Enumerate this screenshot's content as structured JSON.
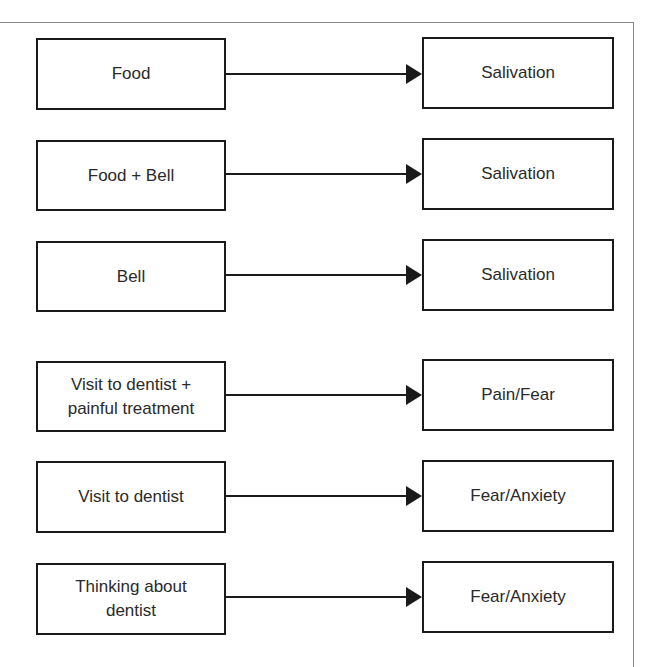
{
  "diagram": {
    "type": "flow",
    "rows": [
      {
        "stimulus": "Food",
        "response": "Salivation"
      },
      {
        "stimulus": "Food + Bell",
        "response": "Salivation"
      },
      {
        "stimulus": "Bell",
        "response": "Salivation"
      },
      {
        "stimulus": "Visit to dentist + painful treatment",
        "response": "Pain/Fear"
      },
      {
        "stimulus": "Visit to dentist",
        "response": "Fear/Anxiety"
      },
      {
        "stimulus": "Thinking about dentist",
        "response": "Fear/Anxiety"
      }
    ],
    "colors": {
      "box_border": "#1a1a1a",
      "arrow": "#1a1a1a",
      "frame": "#8a8a8a",
      "text": "#2a2a2a"
    }
  }
}
